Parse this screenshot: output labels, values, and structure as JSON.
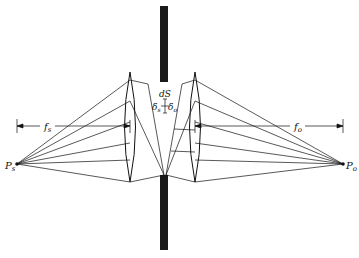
{
  "diagram": {
    "labels": {
      "source_point": "P",
      "source_point_sub": "s",
      "observer_point": "P",
      "observer_point_sub": "o",
      "source_focal_length": "f",
      "source_focal_length_sub": "s",
      "observer_focal_length": "f",
      "observer_focal_length_sub": "o",
      "surface_element": "dS",
      "delta_s": "δ",
      "delta_s_sub": "s",
      "delta_o": "δ",
      "delta_o_sub": "o"
    },
    "colors": {
      "line": "#111111",
      "screen": "#1a1a1a",
      "background": "#ffffff"
    }
  }
}
